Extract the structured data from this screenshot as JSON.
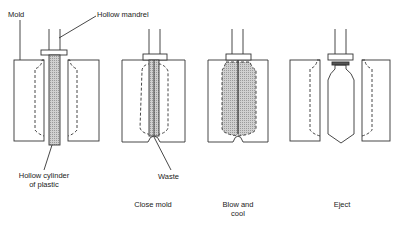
{
  "diagram": {
    "labels": {
      "mold": "Mold",
      "mandrel": "Hollow mandrel",
      "parison_line1": "Hollow cylinder",
      "parison_line2": "of plastic",
      "waste": "Waste"
    },
    "steps": [
      {
        "id": "step-1",
        "caption_line1": "",
        "caption_line2": ""
      },
      {
        "id": "step-2",
        "caption_line1": "Close mold",
        "caption_line2": ""
      },
      {
        "id": "step-3",
        "caption_line1": "Blow and",
        "caption_line2": "cool"
      },
      {
        "id": "step-4",
        "caption_line1": "Eject",
        "caption_line2": ""
      }
    ],
    "colors": {
      "line": "#333333",
      "fill": "#c8c8c8"
    }
  }
}
